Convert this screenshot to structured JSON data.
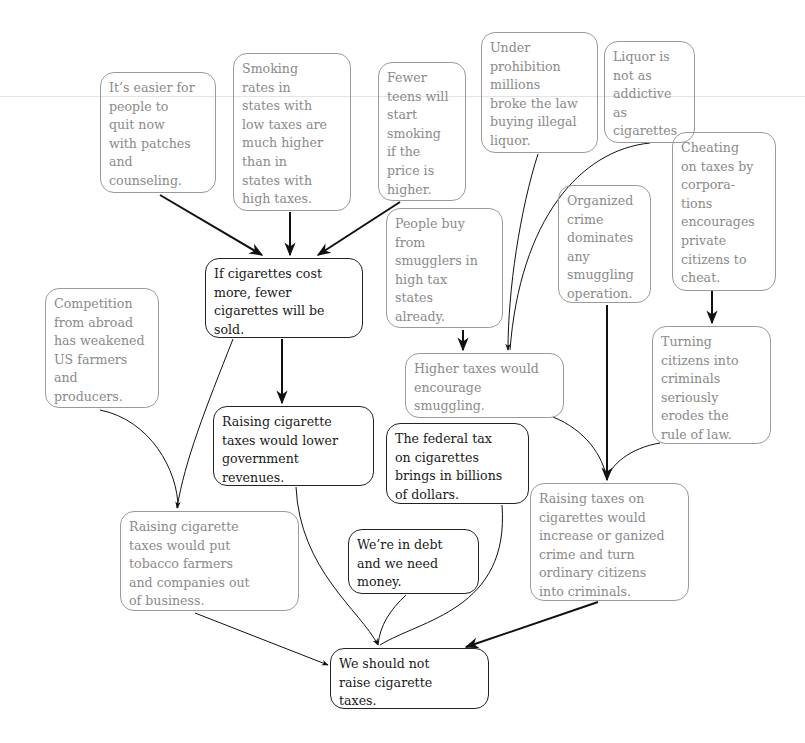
{
  "diagram": {
    "type": "argument map",
    "conclusion": "We should not raise cigarette taxes.",
    "nodes": [
      {
        "id": "A",
        "text": "It’s easier for\npeople to\nquit now\nwith patches\nand\ncounseling.",
        "style": "dim"
      },
      {
        "id": "B",
        "text": "Smoking\nrates in\nstates with\nlow taxes are\nmuch higher\nthan in\nstates with\nhigh taxes.",
        "style": "dim"
      },
      {
        "id": "C",
        "text": "Fewer\nteens will\nstart\nsmoking\nif the\nprice is\nhigher.",
        "style": "dim"
      },
      {
        "id": "D",
        "text": "Under\nprohibition\nmillions\nbroke the law\nbuying illegal\nliquor.",
        "style": "dim"
      },
      {
        "id": "E",
        "text": "Liquor is\nnot as\naddictive\nas\ncigarettes",
        "style": "dim"
      },
      {
        "id": "F",
        "text": "Cheating\non taxes by\ncorpora-\ntions\nencourages\nprivate\ncitizens to\ncheat.",
        "style": "dim"
      },
      {
        "id": "G",
        "text": "Organized\ncrime\ndominates\nany\nsmuggling\noperation.",
        "style": "dim"
      },
      {
        "id": "H",
        "text": "People buy\nfrom\nsmugglers in\nhigh tax\nstates\nalready.",
        "style": "dim"
      },
      {
        "id": "I",
        "text": "If cigarettes cost\nmore, fewer\ncigarettes will be\nsold.",
        "style": "strong"
      },
      {
        "id": "J",
        "text": "Competition\nfrom abroad\nhas weakened\nUS farmers\nand\nproducers.",
        "style": "dim"
      },
      {
        "id": "K",
        "text": "Higher taxes would\nencourage\nsmuggling.",
        "style": "dim"
      },
      {
        "id": "L",
        "text": "Turning\ncitizens into\ncriminals\nseriously\nerodes the\nrule of law.",
        "style": "dim"
      },
      {
        "id": "M",
        "text": "Raising cigarette\ntaxes would lower\ngovernment\nrevenues.",
        "style": "strong"
      },
      {
        "id": "N",
        "text": "The federal tax\non cigarettes\nbrings in billions\nof dollars.",
        "style": "strong"
      },
      {
        "id": "O",
        "text": "Raising taxes on\ncigarettes would\nincrease or ganized\ncrime and turn\nordinary citizens\ninto criminals.",
        "style": "dim"
      },
      {
        "id": "P",
        "text": "Raising cigarette\ntaxes would put\ntobacco farmers\nand companies out\nof business.",
        "style": "dim"
      },
      {
        "id": "Q",
        "text": "We’re in debt\nand we need\nmoney.",
        "style": "strong"
      },
      {
        "id": "R",
        "text": "We should not\nraise cigarette\ntaxes.",
        "style": "strong"
      }
    ],
    "edges": [
      {
        "from": "A",
        "to": "I",
        "weight": "bold"
      },
      {
        "from": "B",
        "to": "I",
        "weight": "bold"
      },
      {
        "from": "C",
        "to": "I",
        "weight": "bold"
      },
      {
        "from": "I",
        "to": "M",
        "weight": "bold"
      },
      {
        "from": "I",
        "to": "P",
        "weight": "thin"
      },
      {
        "from": "J",
        "to": "P",
        "weight": "thin"
      },
      {
        "from": "H",
        "to": "K",
        "weight": "bold"
      },
      {
        "from": "D",
        "to": "K",
        "weight": "thin"
      },
      {
        "from": "E",
        "to": "K",
        "weight": "thin"
      },
      {
        "from": "F",
        "to": "L",
        "weight": "bold"
      },
      {
        "from": "G",
        "to": "O",
        "weight": "bold"
      },
      {
        "from": "K",
        "to": "O",
        "weight": "thin"
      },
      {
        "from": "L",
        "to": "O",
        "weight": "thin"
      },
      {
        "from": "M",
        "to": "R",
        "weight": "thin"
      },
      {
        "from": "N",
        "to": "R",
        "weight": "thin"
      },
      {
        "from": "Q",
        "to": "R",
        "weight": "thin"
      },
      {
        "from": "P",
        "to": "R",
        "weight": "thin"
      },
      {
        "from": "O",
        "to": "R",
        "weight": "bold"
      }
    ]
  }
}
